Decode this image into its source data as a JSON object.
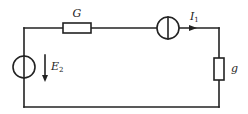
{
  "diagram": {
    "type": "electric-circuit",
    "colors": {
      "line": "#222222",
      "background": "#ffffff"
    },
    "components": [
      {
        "id": "G",
        "kind": "resistor",
        "label": "G",
        "position": "top-left branch"
      },
      {
        "id": "I1",
        "kind": "current-source",
        "label": "I",
        "label_sub": "1",
        "position": "top-right branch",
        "direction": "right"
      },
      {
        "id": "g",
        "kind": "resistor",
        "label": "g",
        "position": "right branch"
      },
      {
        "id": "E2",
        "kind": "voltage-source",
        "label": "E",
        "label_sub": "2",
        "position": "left branch",
        "direction": "down"
      }
    ],
    "labels": {
      "G": "G",
      "I1_main": "I",
      "I1_sub": "1",
      "g": "g",
      "E2_main": "E",
      "E2_sub": "2"
    }
  }
}
